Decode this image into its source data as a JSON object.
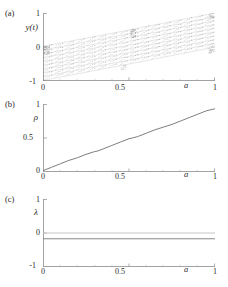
{
  "figure": {
    "background": "#ffffff",
    "axis_color": "#8a8a8a",
    "curve_color": "#6e6e6e",
    "zero_line_color": "#c8c8c8",
    "lambda_line_color": "#7a7a7a",
    "attractor_color": "#555555"
  },
  "panels": [
    {
      "id": "a",
      "label": "(a)",
      "ylabel": "y(t)",
      "xlabel": "a",
      "yticks": [
        "1",
        "0",
        "-1"
      ],
      "ytick_values": [
        1,
        0,
        -1
      ],
      "xticks": [
        "0",
        "0.5",
        "1"
      ],
      "xtick_values": [
        0,
        0.5,
        1
      ]
    },
    {
      "id": "b",
      "label": "(b)",
      "ylabel": "ρ",
      "xlabel": "a",
      "yticks": [
        "1",
        "0.5",
        "0"
      ],
      "ytick_values": [
        1,
        0.5,
        0
      ],
      "xticks": [
        "0",
        "0.5",
        "1"
      ],
      "xtick_values": [
        0,
        0.5,
        1
      ]
    },
    {
      "id": "c",
      "label": "(c)",
      "ylabel": "λ",
      "xlabel": "a",
      "yticks": [
        "1",
        "0",
        "-1"
      ],
      "ytick_values": [
        1,
        0,
        -1
      ],
      "xticks": [
        "0",
        "0.5",
        "1"
      ],
      "xtick_values": [
        0,
        0.5,
        1
      ]
    }
  ],
  "chart_data": [
    {
      "type": "scatter",
      "panel": "a",
      "title": "(a)",
      "xlabel": "a",
      "ylabel": "y(t)",
      "xlim": [
        0,
        1
      ],
      "ylim": [
        -1,
        1
      ],
      "xticks": [
        0,
        0.5,
        1
      ],
      "yticks": [
        -1,
        0,
        1
      ],
      "grid": false,
      "legend": null,
      "description": "Fractal fan of diagonal line segments; self-similar triangular clusters widening with a; vertical discontinuity near a = 0.5",
      "envelope_upper": {
        "x": [
          0,
          0.12,
          0.25,
          0.37,
          0.49,
          0.5,
          0.62,
          0.75,
          0.87,
          1.0
        ],
        "y": [
          0.02,
          0.12,
          0.24,
          0.36,
          0.47,
          0.5,
          0.62,
          0.74,
          0.87,
          1.0
        ]
      },
      "envelope_lower": {
        "x": [
          0,
          0.12,
          0.25,
          0.37,
          0.49,
          0.5,
          0.62,
          0.75,
          0.87,
          1.0
        ],
        "y": [
          -0.98,
          -0.88,
          -0.76,
          -0.64,
          -0.53,
          -0.5,
          -0.38,
          -0.26,
          -0.13,
          0.0
        ]
      },
      "discontinuity_x": 0.5,
      "band_count": 9,
      "cluster_columns": 8
    },
    {
      "type": "line",
      "panel": "b",
      "title": "(b)",
      "xlabel": "a",
      "ylabel": "ρ",
      "xlim": [
        0,
        1
      ],
      "ylim": [
        0,
        1
      ],
      "xticks": [
        0,
        0.5,
        1
      ],
      "yticks": [
        0,
        0.5,
        1
      ],
      "grid": false,
      "legend": null,
      "description": "Monotonic devil's staircase rotation number, nearly linear with small plateaus",
      "x": [
        0.0,
        0.05,
        0.1,
        0.15,
        0.2,
        0.25,
        0.3,
        0.32,
        0.35,
        0.4,
        0.45,
        0.5,
        0.52,
        0.55,
        0.6,
        0.65,
        0.7,
        0.75,
        0.8,
        0.85,
        0.9,
        0.95,
        1.0
      ],
      "y": [
        0.02,
        0.07,
        0.12,
        0.17,
        0.21,
        0.26,
        0.3,
        0.31,
        0.34,
        0.39,
        0.44,
        0.49,
        0.5,
        0.52,
        0.57,
        0.62,
        0.66,
        0.7,
        0.75,
        0.8,
        0.85,
        0.9,
        0.93
      ]
    },
    {
      "type": "line",
      "panel": "c",
      "title": "(c)",
      "xlabel": "a",
      "ylabel": "λ",
      "xlim": [
        0,
        1
      ],
      "ylim": [
        -1,
        1
      ],
      "xticks": [
        0,
        0.5,
        1
      ],
      "yticks": [
        -1,
        0,
        1
      ],
      "grid": false,
      "legend": null,
      "description": "Lyapunov exponent is flat and slightly negative across the whole range; a faint reference line sits at zero",
      "series": [
        {
          "name": "lambda",
          "x": [
            0,
            1
          ],
          "y": [
            -0.17,
            -0.17
          ]
        },
        {
          "name": "zero-reference",
          "x": [
            0,
            1
          ],
          "y": [
            0,
            0
          ]
        }
      ]
    }
  ]
}
